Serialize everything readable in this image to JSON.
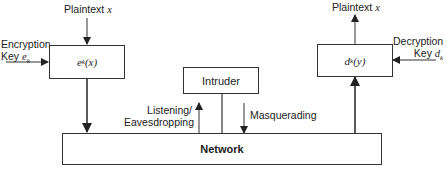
{
  "diagram": {
    "encryptor": {
      "label_fn": "e",
      "label_sub": "k",
      "label_arg": "(x)",
      "input_top": {
        "text": "Plaintext",
        "var": "x"
      },
      "input_left": {
        "line1": "Encryption",
        "line2": "Key",
        "var": "e",
        "sub": "k"
      }
    },
    "decryptor": {
      "label_fn": "d",
      "label_sub": "k",
      "label_arg": "(y)",
      "output_top": {
        "text": "Plaintext",
        "var": "x"
      },
      "input_right": {
        "line1": "Decryption",
        "line2": "Key",
        "var": "d",
        "sub": "k"
      }
    },
    "intruder": {
      "label": "Intruder"
    },
    "network": {
      "label": "Network"
    },
    "attacks": {
      "listening": {
        "line1": "Listening/",
        "line2": "Eavesdropping"
      },
      "masquerading": {
        "label": "Masquerading"
      }
    }
  }
}
